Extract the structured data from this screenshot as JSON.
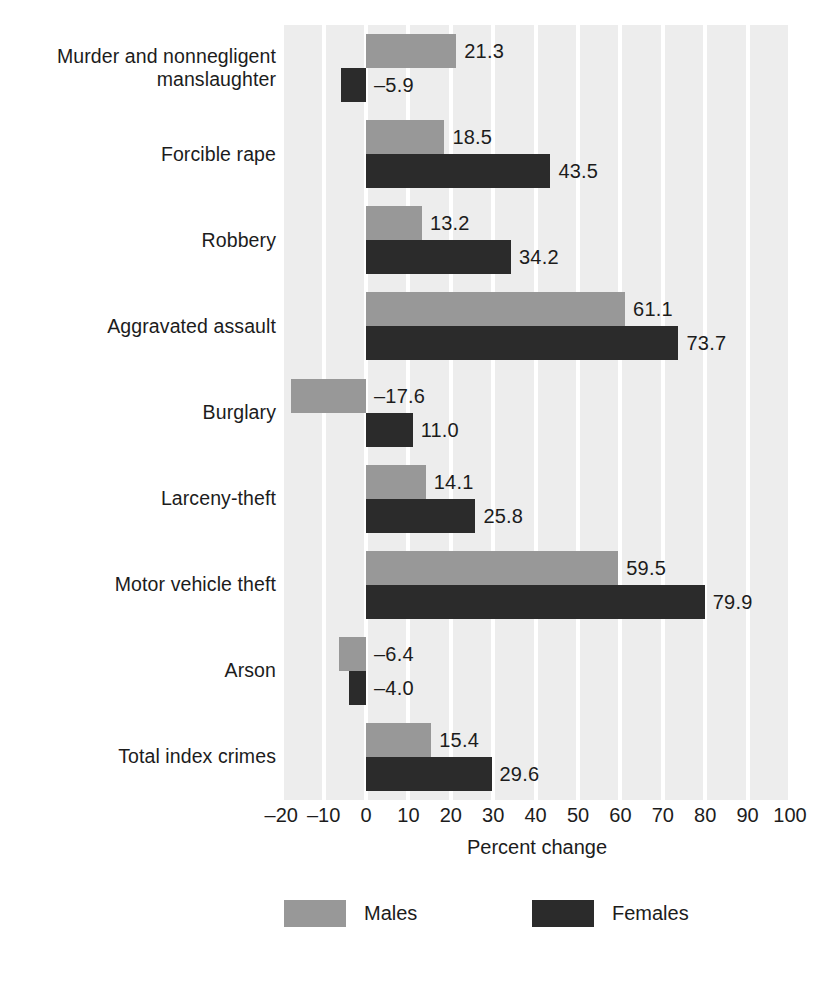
{
  "chart_data": {
    "type": "bar",
    "orientation": "horizontal",
    "title": "",
    "xlabel": "Percent change",
    "ylabel": "",
    "xlim": [
      -20,
      100
    ],
    "xticks": [
      -20,
      -10,
      0,
      10,
      20,
      30,
      40,
      50,
      60,
      70,
      80,
      90,
      100
    ],
    "xticklabels": [
      "–20",
      "–10",
      "0",
      "10",
      "20",
      "30",
      "40",
      "50",
      "60",
      "70",
      "80",
      "90",
      "100"
    ],
    "grid": true,
    "legend_position": "bottom",
    "categories": [
      "Murder and nonnegligent manslaughter",
      "Forcible rape",
      "Robbery",
      "Aggravated assault",
      "Burglary",
      "Larceny-theft",
      "Motor vehicle theft",
      "Arson",
      "Total index crimes"
    ],
    "category_lines": [
      [
        "Murder and nonnegligent",
        "manslaughter"
      ],
      [
        "Forcible rape"
      ],
      [
        "Robbery"
      ],
      [
        "Aggravated assault"
      ],
      [
        "Burglary"
      ],
      [
        "Larceny-theft"
      ],
      [
        "Motor vehicle theft"
      ],
      [
        "Arson"
      ],
      [
        "Total index crimes"
      ]
    ],
    "series": [
      {
        "name": "Males",
        "color": "#989898",
        "values": [
          21.3,
          18.5,
          13.2,
          61.1,
          -17.6,
          14.1,
          59.5,
          -6.4,
          15.4
        ],
        "labels": [
          "21.3",
          "18.5",
          "13.2",
          "61.1",
          "–17.6",
          "14.1",
          "59.5",
          "–6.4",
          "15.4"
        ]
      },
      {
        "name": "Females",
        "color": "#2b2b2b",
        "values": [
          -5.9,
          43.5,
          34.2,
          73.7,
          11.0,
          25.8,
          79.9,
          -4.0,
          29.6
        ],
        "labels": [
          "–5.9",
          "43.5",
          "34.2",
          "73.7",
          "11.0",
          "25.8",
          "79.9",
          "–4.0",
          "29.6"
        ]
      }
    ]
  },
  "axis": {
    "title": "Percent change"
  },
  "legend": {
    "items": [
      {
        "label": "Males",
        "color": "#989898"
      },
      {
        "label": "Females",
        "color": "#2b2b2b"
      }
    ]
  },
  "colors": {
    "plot_background": "#ededed",
    "gridline": "#ffffff",
    "males": "#989898",
    "females": "#2b2b2b",
    "text": "#1c1c1c",
    "page_background": "#ffffff"
  }
}
